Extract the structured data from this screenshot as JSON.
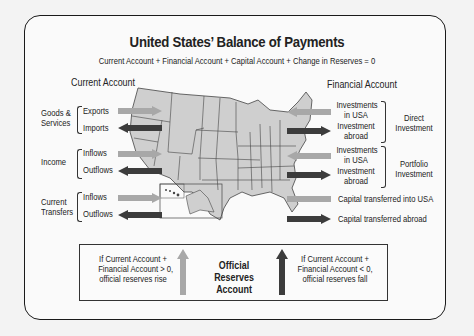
{
  "title": "United States’ Balance of Payments",
  "formula": "Current Account + Financial Account + Capital Account + Change in Reserves = 0",
  "colors": {
    "inflow_arrow": "#a8a8a8",
    "outflow_arrow": "#3c3c3c",
    "map_fill": "#cfcfcf",
    "map_stroke": "#444444"
  },
  "current_account": {
    "heading": "Current Account",
    "groups": [
      {
        "label_line1": "Goods &",
        "label_line2": "Services",
        "items": [
          "Exports",
          "Imports"
        ]
      },
      {
        "label_line1": "Income",
        "label_line2": "",
        "items": [
          "Inflows",
          "Outflows"
        ]
      },
      {
        "label_line1": "Current",
        "label_line2": "Transfers",
        "items": [
          "Inflows",
          "Outflows"
        ]
      }
    ]
  },
  "financial_account": {
    "heading": "Financial Account",
    "groups": [
      {
        "label_line1": "Direct",
        "label_line2": "Investment",
        "items": [
          {
            "line1": "Investments",
            "line2": "in USA"
          },
          {
            "line1": "Investment",
            "line2": "abroad"
          }
        ]
      },
      {
        "label_line1": "Portfolio",
        "label_line2": "Investment",
        "items": [
          {
            "line1": "Investments",
            "line2": "in USA"
          },
          {
            "line1": "Investment",
            "line2": "abroad"
          }
        ]
      }
    ]
  },
  "capital_account": {
    "items": [
      "Capital transferred into USA",
      "Capital transferred abroad"
    ]
  },
  "reserves": {
    "title_line1": "Official Reserves",
    "title_line2": "Account",
    "left_line1": "If Current Account +",
    "left_line2": "Financial Account > 0,",
    "left_line3": "official reserves rise",
    "right_line1": "If Current Account +",
    "right_line2": "Financial Account < 0,",
    "right_line3": "official reserves fall"
  }
}
